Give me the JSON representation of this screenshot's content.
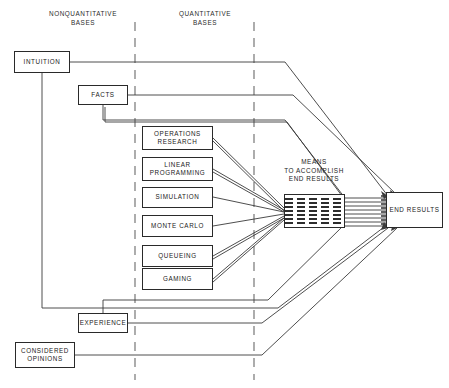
{
  "diagram": {
    "title": "",
    "background_color": "#ffffff",
    "line_color": "#2a2a2a",
    "text_color": "#222222"
  },
  "column_headers": [
    {
      "id": "nonquantitative",
      "label": "NONQUANTITATIVE\nBASES"
    },
    {
      "id": "quantitative",
      "label": "QUANTITATIVE\nBASES"
    }
  ],
  "nodes": {
    "intuition": {
      "label": "INTUITION"
    },
    "facts": {
      "label": "FACTS"
    },
    "operations_research": {
      "label": "OPERATIONS\nRESEARCH"
    },
    "linear_programming": {
      "label": "LINEAR\nPROGRAMMING"
    },
    "simulation": {
      "label": "SIMULATION"
    },
    "monte_carlo": {
      "label": "MONTE CARLO"
    },
    "queueing": {
      "label": "QUEUEING"
    },
    "gaming": {
      "label": "GAMING"
    },
    "experience": {
      "label": "EXPERIENCE"
    },
    "considered_opinions": {
      "label": "CONSIDERED\nOPINIONS"
    },
    "means": {
      "label": "MEANS\nTO ACCOMPLISH\nEND RESULTS"
    },
    "end_results": {
      "label": "END RESULTS"
    }
  },
  "divider_lines": [
    {
      "id": "divider-left",
      "x": 135
    },
    {
      "id": "divider-right",
      "x": 254
    }
  ]
}
